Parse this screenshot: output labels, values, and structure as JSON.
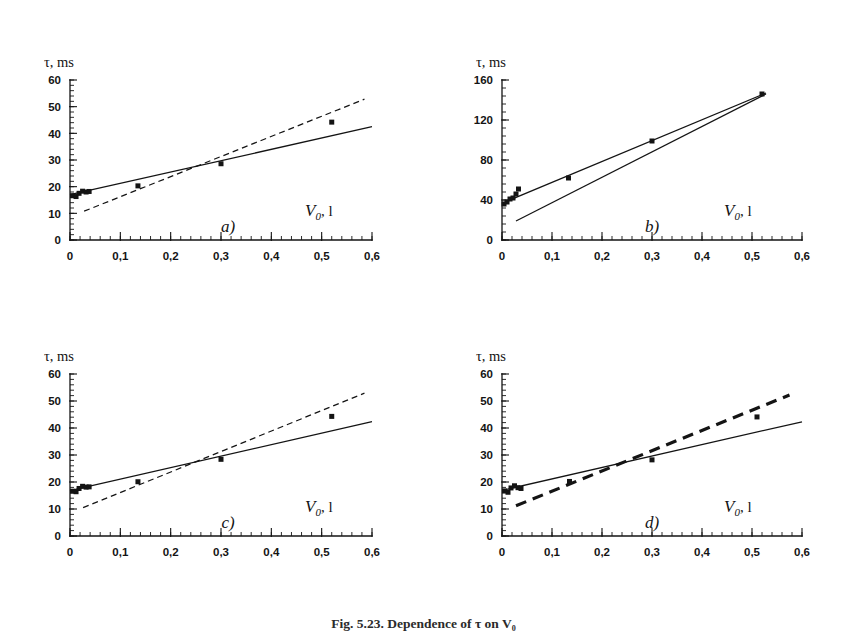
{
  "figure": {
    "caption": "Fig. 5.23. Dependence of τ on V₀",
    "panel_count": 4,
    "line_color": "#141414",
    "marker_color": "#141414",
    "background": "#ffffff"
  },
  "chart_data": [
    {
      "id": "panel-a",
      "type": "scatter",
      "label": "a)",
      "title": "",
      "xlabel": "V₀, l",
      "ylabel": "τ, ms",
      "y_axis_unit": "ms",
      "x_axis_unit": "l",
      "xlim": [
        0,
        0.6
      ],
      "ylim": [
        0,
        60
      ],
      "xticks": [
        0,
        0.1,
        0.2,
        0.3,
        0.4,
        0.5,
        0.6
      ],
      "xtick_labels": [
        "0",
        "0,1",
        "0,2",
        "0,3",
        "0,4",
        "0,5",
        "0,6"
      ],
      "yticks": [
        0,
        10,
        20,
        30,
        40,
        50,
        60
      ],
      "ytick_labels": [
        "0",
        "10",
        "20",
        "30",
        "40",
        "50",
        "60"
      ],
      "x_minor_step": 0.02,
      "y_minor_step": 2,
      "grid": false,
      "legend": null,
      "points": [
        {
          "x": 0.005,
          "y": 16.6
        },
        {
          "x": 0.012,
          "y": 16.3
        },
        {
          "x": 0.018,
          "y": 17.5
        },
        {
          "x": 0.025,
          "y": 18.3
        },
        {
          "x": 0.032,
          "y": 18.0
        },
        {
          "x": 0.038,
          "y": 18.2
        },
        {
          "x": 0.135,
          "y": 20.3
        },
        {
          "x": 0.3,
          "y": 28.6
        },
        {
          "x": 0.52,
          "y": 44.2
        }
      ],
      "series": [
        {
          "name": "experimental fit",
          "style": "solid",
          "thickness": "thin",
          "x": [
            0.0,
            0.6
          ],
          "y": [
            17.0,
            42.5
          ]
        },
        {
          "name": "model",
          "style": "dashed",
          "thickness": "thin",
          "x": [
            0.028,
            0.585
          ],
          "y": [
            10.8,
            52.8
          ]
        }
      ]
    },
    {
      "id": "panel-b",
      "type": "scatter",
      "label": "b)",
      "title": "",
      "xlabel": "V₀, l",
      "ylabel": "τ, ms",
      "y_axis_unit": "ms",
      "x_axis_unit": "l",
      "xlim": [
        0,
        0.6
      ],
      "ylim": [
        0,
        160
      ],
      "xticks": [
        0,
        0.1,
        0.2,
        0.3,
        0.4,
        0.5,
        0.6
      ],
      "xtick_labels": [
        "0",
        "0,1",
        "0,2",
        "0,3",
        "0,4",
        "0,5",
        "0,6"
      ],
      "yticks": [
        0,
        40,
        80,
        120,
        160
      ],
      "ytick_labels": [
        "0",
        "40",
        "80",
        "120",
        "160"
      ],
      "x_minor_step": 0.02,
      "y_minor_step": 8,
      "grid": false,
      "legend": null,
      "points": [
        {
          "x": 0.004,
          "y": 36.0
        },
        {
          "x": 0.01,
          "y": 38.0
        },
        {
          "x": 0.016,
          "y": 41.0
        },
        {
          "x": 0.022,
          "y": 42.0
        },
        {
          "x": 0.028,
          "y": 46.0
        },
        {
          "x": 0.033,
          "y": 51.0
        },
        {
          "x": 0.133,
          "y": 62.0
        },
        {
          "x": 0.3,
          "y": 99.0
        },
        {
          "x": 0.52,
          "y": 146.0
        }
      ],
      "series": [
        {
          "name": "experimental fit",
          "style": "solid",
          "thickness": "thin",
          "x": [
            0.006,
            0.528
          ],
          "y": [
            38.0,
            147.0
          ]
        },
        {
          "name": "model",
          "style": "solid",
          "thickness": "thin",
          "x": [
            0.028,
            0.528
          ],
          "y": [
            19.0,
            146.0
          ]
        }
      ]
    },
    {
      "id": "panel-c",
      "type": "scatter",
      "label": "c)",
      "title": "",
      "xlabel": "V₀, l",
      "ylabel": "τ, ms",
      "y_axis_unit": "ms",
      "x_axis_unit": "l",
      "xlim": [
        0,
        0.6
      ],
      "ylim": [
        0,
        60
      ],
      "xticks": [
        0,
        0.1,
        0.2,
        0.3,
        0.4,
        0.5,
        0.6
      ],
      "xtick_labels": [
        "0",
        "0,1",
        "0,2",
        "0,3",
        "0,4",
        "0,5",
        "0,6"
      ],
      "yticks": [
        0,
        10,
        20,
        30,
        40,
        50,
        60
      ],
      "ytick_labels": [
        "0",
        "10",
        "20",
        "30",
        "40",
        "50",
        "60"
      ],
      "x_minor_step": 0.02,
      "y_minor_step": 2,
      "grid": false,
      "legend": null,
      "points": [
        {
          "x": 0.005,
          "y": 16.6
        },
        {
          "x": 0.012,
          "y": 16.4
        },
        {
          "x": 0.018,
          "y": 17.6
        },
        {
          "x": 0.025,
          "y": 18.4
        },
        {
          "x": 0.032,
          "y": 18.1
        },
        {
          "x": 0.038,
          "y": 18.2
        },
        {
          "x": 0.135,
          "y": 20.1
        },
        {
          "x": 0.3,
          "y": 28.4
        },
        {
          "x": 0.52,
          "y": 44.3
        }
      ],
      "series": [
        {
          "name": "experimental fit",
          "style": "solid",
          "thickness": "thin",
          "x": [
            0.0,
            0.6
          ],
          "y": [
            16.8,
            42.4
          ]
        },
        {
          "name": "model",
          "style": "dashed",
          "thickness": "thin",
          "x": [
            0.026,
            0.585
          ],
          "y": [
            10.5,
            52.9
          ]
        }
      ]
    },
    {
      "id": "panel-d",
      "type": "scatter",
      "label": "d)",
      "title": "",
      "xlabel": "V₀, l",
      "ylabel": "τ, ms",
      "y_axis_unit": "ms",
      "x_axis_unit": "l",
      "xlim": [
        0,
        0.6
      ],
      "ylim": [
        0,
        60
      ],
      "xticks": [
        0,
        0.1,
        0.2,
        0.3,
        0.4,
        0.5,
        0.6
      ],
      "xtick_labels": [
        "0",
        "0,1",
        "0,2",
        "0,3",
        "0,4",
        "0,5",
        "0,6"
      ],
      "yticks": [
        0,
        10,
        20,
        30,
        40,
        50,
        60
      ],
      "ytick_labels": [
        "0",
        "10",
        "20",
        "30",
        "40",
        "50",
        "60"
      ],
      "x_minor_step": 0.02,
      "y_minor_step": 2,
      "grid": false,
      "legend": null,
      "points": [
        {
          "x": 0.005,
          "y": 16.7
        },
        {
          "x": 0.012,
          "y": 16.2
        },
        {
          "x": 0.018,
          "y": 17.8
        },
        {
          "x": 0.025,
          "y": 18.6
        },
        {
          "x": 0.032,
          "y": 17.9
        },
        {
          "x": 0.038,
          "y": 17.6
        },
        {
          "x": 0.135,
          "y": 20.2
        },
        {
          "x": 0.3,
          "y": 28.2
        },
        {
          "x": 0.51,
          "y": 44.1
        }
      ],
      "series": [
        {
          "name": "experimental fit",
          "style": "solid",
          "thickness": "thin",
          "x": [
            0.0,
            0.6
          ],
          "y": [
            16.9,
            42.3
          ]
        },
        {
          "name": "model",
          "style": "dashed",
          "thickness": "thick",
          "x": [
            0.028,
            0.575
          ],
          "y": [
            11.2,
            52.2
          ]
        }
      ]
    }
  ]
}
